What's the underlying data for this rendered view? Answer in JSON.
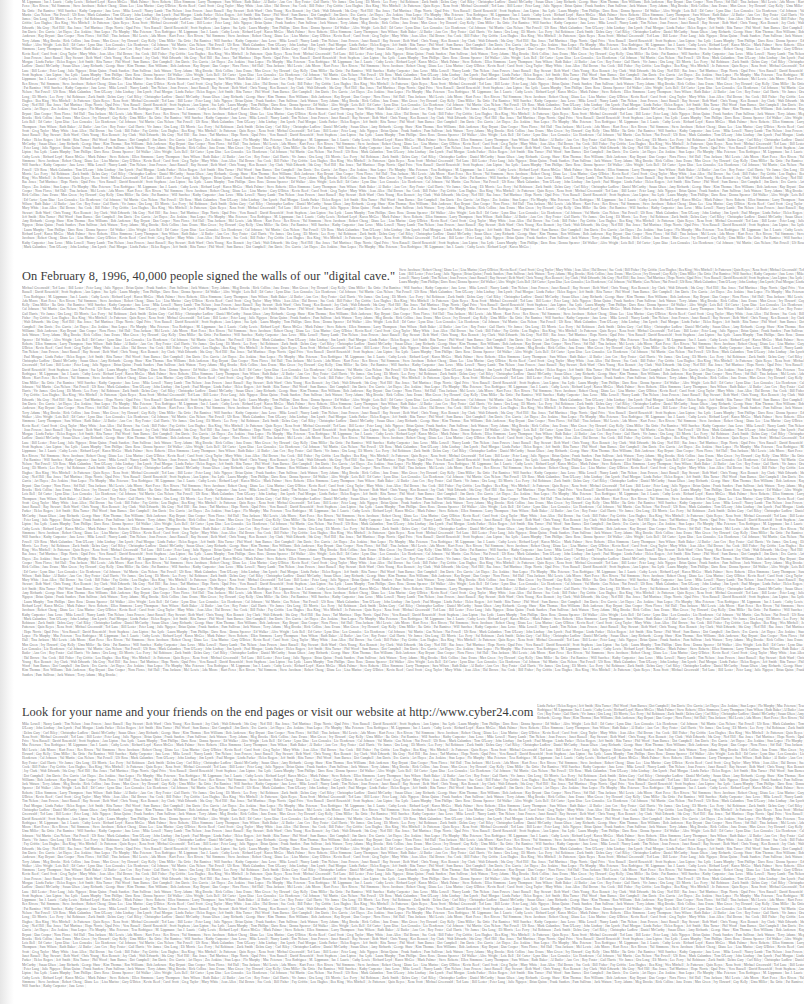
{
  "document": {
    "headlines": [
      {
        "text": "On February 8, 1996, 40,000 people signed the walls of our \"digital cave.\"",
        "top": 268
      },
      {
        "text": "Look for your name and your friends on the end pages or visit our website at http://www.cyber24.com",
        "top": 704
      }
    ],
    "name_wall": {
      "description": "Dense justified wall of tiny signatory names separated by vertical bars",
      "separator": "|",
      "names": [
        "M. Lippmann",
        "Mark Galambos",
        "David Rosenfeld",
        "Kathy Carpenter",
        "Michael Greenwald",
        "Steve Jacobson",
        "Debra Gary",
        "Ian J. Laurie",
        "Tom O'Leary",
        "Scott Stephens",
        "Jane Lowe",
        "Ted Lane",
        "Robert Cheng",
        "Carl Riley",
        "Cathy Lewis",
        "John Lindsay",
        "Ann Lipton",
        "Mike Lowell",
        "Bill Lester",
        "Diane Lee",
        "Christopher Ludlow",
        "Richard Loyd",
        "Jim Lynch",
        "Sue Lytle",
        "Nancy Lamb",
        "Peter Lang",
        "Lisa Marino",
        "Daniel McCarthy",
        "Karen McGee",
        "Paul Morgan",
        "Laura Murphy",
        "Tim Nelson",
        "Julie Nguyen",
        "Gary O'Brien",
        "Susan Olsen",
        "Mark Palmer",
        "Linda Parker",
        "Tom Phillips",
        "Joan Powers",
        "Brian Quinn",
        "Kevin Reed",
        "Amy Richards",
        "Steve Roberts",
        "Helen Rogers",
        "Dave Ross",
        "Janet Russell",
        "Frank Sanders",
        "Carol Scott",
        "George Shaw",
        "Ellen Simmons",
        "Jeff Smith",
        "Donna Spencer",
        "Ray Stewart",
        "Pam Sullivan",
        "Greg Taylor",
        "Kim Thomas",
        "Larry Thompson",
        "Rita Turner",
        "Ed Walker",
        "Beth Ward",
        "Jack Watson",
        "Mary White",
        "Ron Williams",
        "Sara Wilson",
        "Phil Wood",
        "Alice Wright",
        "Chris Young",
        "Terry Adams",
        "Jean Allen",
        "Bob Anderson",
        "Ruth Baker",
        "Sam Barnes",
        "Lois Bell",
        "Ken Bennett",
        "Meg Brooks",
        "Hal Brown",
        "Kay Bryant",
        "Al Butler",
        "Dot Campbell",
        "Ed Carter",
        "Joy Clark",
        "Rick Collins",
        "Sue Cook",
        "Dan Cooper",
        "Ann Cox",
        "Jim Davis",
        "Lynn Diaz",
        "Walt Edwards",
        "June Evans",
        "Bill Fisher",
        "Nora Flores",
        "Roy Foster",
        "Eve Garcia",
        "Len Gonzales",
        "Ida Gray",
        "Max Green",
        "Fay Griffin",
        "Sid Hall",
        "Gail Harris",
        "Art Hayes",
        "Liz Henderson",
        "Ned Hill",
        "Ivy Howard",
        "Lou Hughes",
        "Tina Jackson",
        "Vic James",
        "Zoe Jenkins",
        "Cal Johnson",
        "Rae Jones",
        "Guy Kelly",
        "Bea King",
        "Mel Lewis",
        "Ora Long",
        "Stan Lopez",
        "Val Martin",
        "Tad Martinez",
        "Uma Miller",
        "Wes Mitchell",
        "Ada Moore",
        "Eli Morris",
        "Flo Murphy",
        "Gus Nelson",
        "Hope Norris",
        "Ike Ortiz",
        "Jo Patterson",
        "Kurt Perez",
        "Lee Perry",
        "Mae Peterson",
        "Nat Powell",
        "Opal Price",
        "Pat Ramirez",
        "Quin Reyes",
        "Rex Rivera",
        "Sal Robinson",
        "Tess Rodriguez",
        "Ulf Ross",
        "Vera Russell",
        "Will Sanchez",
        "Xena Scott",
        "Yul Simmons",
        "Zack Smith"
      ]
    }
  },
  "layout_blocks": [
    {
      "name": "names-top",
      "top": 0,
      "height": 266
    },
    {
      "name": "names-middle",
      "top": 286,
      "height": 416
    },
    {
      "name": "names-bottom",
      "top": 722,
      "height": 282
    }
  ],
  "colors": {
    "background": "#ffffff",
    "headline": "#3a3a3a",
    "name_text": "#7a7a7a"
  }
}
